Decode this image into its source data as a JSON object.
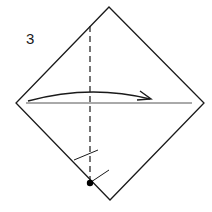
{
  "diagram": {
    "step_number": "3",
    "type": "origami-fold-step",
    "elements": {
      "square_paper": "diamond orientation",
      "valley_fold_line": "vertical dashed line",
      "horizontal_crease": "horizontal line across middle",
      "fold_arrow": "curved arrow pointing right",
      "reference_point": "black dot at bottom edge",
      "tick_marks": 2
    },
    "colors": {
      "stroke": "#1a1a1a",
      "background": "#ffffff"
    }
  }
}
